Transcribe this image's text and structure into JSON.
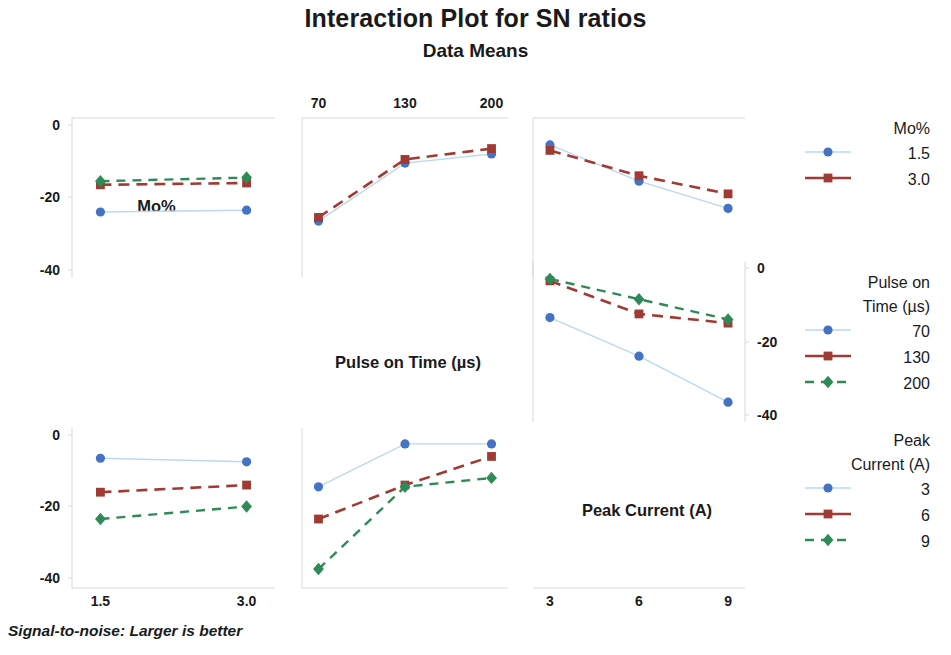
{
  "header": {
    "title": "Interaction Plot for SN ratios",
    "subtitle": "Data Means"
  },
  "footnote": "Signal-to-noise: Larger is better",
  "colors": {
    "series1": "#4472c4",
    "series1_line": "#bdd7ee",
    "series2": "#a03a34",
    "series3": "#2e8b57",
    "axis": "#d9d9d9",
    "text": "#1a1a1a"
  },
  "panel_labels": {
    "mo": "Mo%",
    "pulse": "Pulse on Time (µs)",
    "peak": "Peak Current (A)"
  },
  "axes": {
    "top_ticks": [
      "70",
      "130",
      "200"
    ],
    "bottom_left_ticks": [
      "1.5",
      "3.0"
    ],
    "bottom_right_ticks": [
      "3",
      "6",
      "9"
    ],
    "left_top_ticks": [
      "0",
      "-20",
      "-40"
    ],
    "left_bottom_ticks": [
      "0",
      "-20",
      "-40"
    ],
    "right_mid_ticks": [
      "0",
      "-20",
      "-40"
    ]
  },
  "legends": [
    {
      "id": "legend-mo",
      "title_lines": [
        "Mo%"
      ],
      "entries": [
        {
          "label": "1.5",
          "marker": "circle",
          "color": "#4472c4",
          "line": "solid"
        },
        {
          "label": "3.0",
          "marker": "square",
          "color": "#a03a34",
          "line": "solid"
        }
      ]
    },
    {
      "id": "legend-pulse-on-time",
      "title_lines": [
        "Pulse on",
        "Time (µs)"
      ],
      "entries": [
        {
          "label": "70",
          "marker": "circle",
          "color": "#4472c4",
          "line": "solid"
        },
        {
          "label": "130",
          "marker": "square",
          "color": "#a03a34",
          "line": "solid"
        },
        {
          "label": "200",
          "marker": "diamond",
          "color": "#2e8b57",
          "line": "dashed"
        }
      ]
    },
    {
      "id": "legend-peak-current",
      "title_lines": [
        "Peak",
        "Current (A)"
      ],
      "entries": [
        {
          "label": "3",
          "marker": "circle",
          "color": "#4472c4",
          "line": "solid"
        },
        {
          "label": "6",
          "marker": "square",
          "color": "#a03a34",
          "line": "solid"
        },
        {
          "label": "9",
          "marker": "diamond",
          "color": "#2e8b57",
          "line": "dashed"
        }
      ]
    }
  ],
  "chart_data": {
    "type": "line",
    "title": "Interaction Plot for SN ratios",
    "subtitle": "Data Means",
    "ylabel": "SN ratio (Mean)",
    "note": "Signal-to-noise: Larger is better",
    "factors": [
      {
        "name": "Mo%",
        "levels": [
          "1.5",
          "3.0"
        ]
      },
      {
        "name": "Pulse on Time (µs)",
        "levels": [
          "70",
          "130",
          "200"
        ]
      },
      {
        "name": "Peak Current (A)",
        "levels": [
          "3",
          "6",
          "9"
        ]
      }
    ],
    "ylim": [
      -45,
      3
    ],
    "grid": false,
    "legend_position": "right",
    "panels": [
      {
        "id": "panel-mo-vs-pulse",
        "row": 1,
        "col": 2,
        "xfactor": "Pulse on Time (µs)",
        "x": [
          "70",
          "130",
          "200"
        ],
        "trace_factor": "Mo%",
        "series": [
          {
            "name": "1.5",
            "values": [
              -26.5,
              -10.5,
              -8.0
            ]
          },
          {
            "name": "3.0",
            "values": [
              -25.5,
              -9.5,
              -6.5
            ]
          }
        ]
      },
      {
        "id": "panel-mo-vs-peak",
        "row": 1,
        "col": 3,
        "xfactor": "Peak Current (A)",
        "x": [
          "3",
          "6",
          "9"
        ],
        "trace_factor": "Mo%",
        "series": [
          {
            "name": "1.5",
            "values": [
              -5.5,
              -15.5,
              -23.0
            ]
          },
          {
            "name": "3.0",
            "values": [
              -7.0,
              -14.0,
              -19.0
            ]
          }
        ]
      },
      {
        "id": "panel-pulse-vs-peak",
        "row": 2,
        "col": 3,
        "xfactor": "Peak Current (A)",
        "x": [
          "3",
          "6",
          "9"
        ],
        "trace_factor": "Pulse on Time (µs)",
        "series": [
          {
            "name": "70",
            "values": [
              -13.5,
              -24.0,
              -36.5
            ]
          },
          {
            "name": "130",
            "values": [
              -3.5,
              -12.5,
              -15.0
            ]
          },
          {
            "name": "200",
            "values": [
              -3.0,
              -8.5,
              -14.0
            ]
          }
        ]
      },
      {
        "id": "panel-pulse-vs-mo",
        "row": 2,
        "col": 1,
        "xfactor": "Mo%",
        "x": [
          "1.5",
          "3.0"
        ],
        "trace_factor": "Pulse on Time (µs)",
        "series": [
          {
            "name": "70",
            "values": [
              -24.0,
              -23.5
            ]
          },
          {
            "name": "130",
            "values": [
              -16.5,
              -16.0
            ]
          },
          {
            "name": "200",
            "values": [
              -15.5,
              -14.5
            ]
          }
        ]
      },
      {
        "id": "panel-peak-vs-mo",
        "row": 3,
        "col": 1,
        "xfactor": "Mo%",
        "x": [
          "1.5",
          "3.0"
        ],
        "trace_factor": "Peak Current (A)",
        "series": [
          {
            "name": "3",
            "values": [
              -6.5,
              -7.5
            ]
          },
          {
            "name": "6",
            "values": [
              -16.0,
              -14.0
            ]
          },
          {
            "name": "9",
            "values": [
              -23.5,
              -20.0
            ]
          }
        ]
      },
      {
        "id": "panel-peak-vs-pulse",
        "row": 3,
        "col": 2,
        "xfactor": "Pulse on Time (µs)",
        "x": [
          "70",
          "130",
          "200"
        ],
        "trace_factor": "Peak Current (A)",
        "series": [
          {
            "name": "3",
            "values": [
              -14.5,
              -2.5,
              -2.5
            ]
          },
          {
            "name": "6",
            "values": [
              -23.5,
              -14.0,
              -6.0
            ]
          },
          {
            "name": "9",
            "values": [
              -37.5,
              -14.5,
              -12.0
            ]
          }
        ]
      }
    ]
  }
}
